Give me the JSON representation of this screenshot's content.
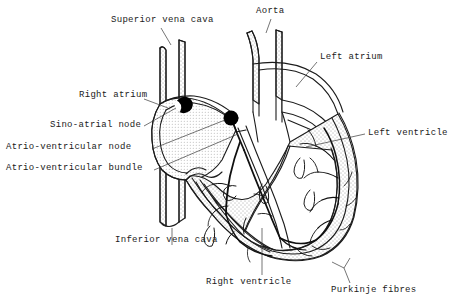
{
  "figure": {
    "background_color": "#ffffff",
    "ink_color": "#1b1b1b",
    "node_fill_color": "#000000",
    "wall_fill_color": "#f2f2f2"
  },
  "labels": {
    "superior_vena_cava": "Superior vena cava",
    "aorta": "Aorta",
    "left_atrium": "Left atrium",
    "right_atrium": "Right atrium",
    "sino_atrial_node": "Sino-atrial node",
    "atrio_ventricular_node": "Atrio-ventricular node",
    "atrio_ventricular_bundle": "Atrio-ventricular bundle",
    "left_ventricle": "Left ventricle",
    "inferior_vena_cava": "Inferior vena cava",
    "right_ventricle": "Right ventricle",
    "purkinje_fibres": "Purkinje fibres"
  },
  "structures": [
    {
      "name": "superior-vena-cava",
      "kind": "vessel"
    },
    {
      "name": "aorta",
      "kind": "vessel"
    },
    {
      "name": "inferior-vena-cava",
      "kind": "vessel"
    },
    {
      "name": "right-atrium",
      "kind": "chamber"
    },
    {
      "name": "left-atrium",
      "kind": "chamber"
    },
    {
      "name": "right-ventricle",
      "kind": "chamber"
    },
    {
      "name": "left-ventricle",
      "kind": "chamber"
    },
    {
      "name": "sino-atrial-node",
      "kind": "node"
    },
    {
      "name": "atrio-ventricular-node",
      "kind": "node"
    },
    {
      "name": "atrio-ventricular-bundle",
      "kind": "conduction-pathway"
    },
    {
      "name": "purkinje-fibres",
      "kind": "conduction-pathway"
    }
  ]
}
